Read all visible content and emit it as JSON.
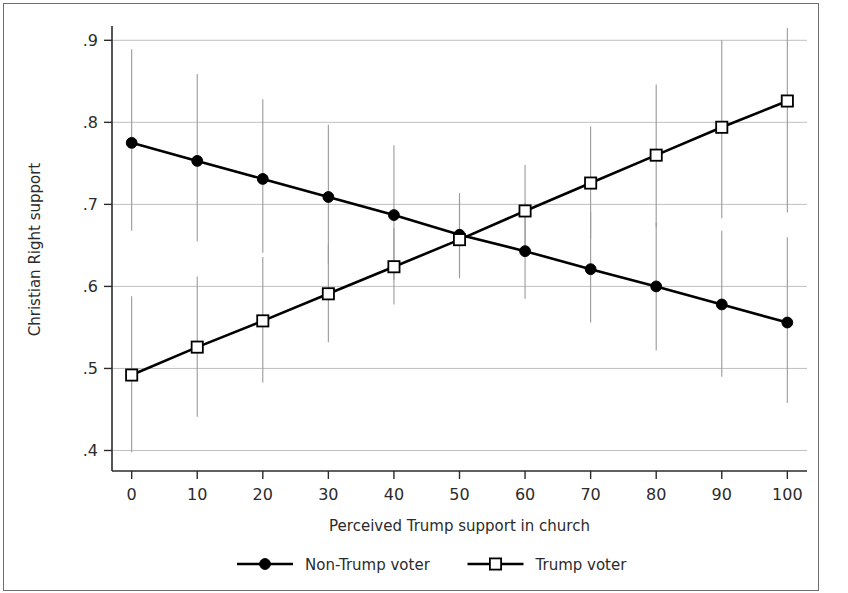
{
  "chart_data": {
    "type": "line",
    "title": "",
    "xlabel": "Perceived Trump support in church",
    "ylabel": "Christian Right support",
    "x": [
      0,
      10,
      20,
      30,
      40,
      50,
      60,
      70,
      80,
      90,
      100
    ],
    "xlim": [
      -3,
      103
    ],
    "ylim": [
      0.375,
      0.915
    ],
    "xticks": [
      "0",
      "10",
      "20",
      "30",
      "40",
      "50",
      "60",
      "70",
      "80",
      "90",
      "100"
    ],
    "yticks": [
      ".4",
      ".5",
      ".6",
      ".7",
      ".8",
      ".9"
    ],
    "ytick_values": [
      0.4,
      0.5,
      0.6,
      0.7,
      0.8,
      0.9
    ],
    "grid": "horizontal",
    "legend_position": "bottom",
    "error_bars": "95% confidence intervals",
    "series": [
      {
        "name": "Non-Trump voter",
        "marker": "filled-circle",
        "values": [
          0.775,
          0.753,
          0.731,
          0.709,
          0.687,
          0.663,
          0.643,
          0.621,
          0.6,
          0.578,
          0.556
        ],
        "ci_low": [
          0.668,
          0.655,
          0.641,
          0.627,
          0.608,
          0.612,
          0.585,
          0.556,
          0.522,
          0.49,
          0.458
        ],
        "ci_high": [
          0.889,
          0.859,
          0.828,
          0.797,
          0.772,
          0.714,
          0.702,
          0.69,
          0.678,
          0.668,
          0.66
        ]
      },
      {
        "name": "Trump voter",
        "marker": "open-square",
        "values": [
          0.492,
          0.526,
          0.558,
          0.591,
          0.624,
          0.657,
          0.692,
          0.726,
          0.76,
          0.794,
          0.826
        ],
        "ci_low": [
          0.398,
          0.441,
          0.483,
          0.532,
          0.578,
          0.61,
          0.639,
          0.658,
          0.672,
          0.683,
          0.69
        ],
        "ci_high": [
          0.588,
          0.612,
          0.636,
          0.651,
          0.671,
          0.707,
          0.748,
          0.795,
          0.846,
          0.9,
          0.952
        ]
      }
    ]
  },
  "legend": {
    "items": [
      {
        "label": "Non-Trump voter",
        "marker": "filled-circle"
      },
      {
        "label": "Trump voter",
        "marker": "open-square"
      }
    ]
  }
}
